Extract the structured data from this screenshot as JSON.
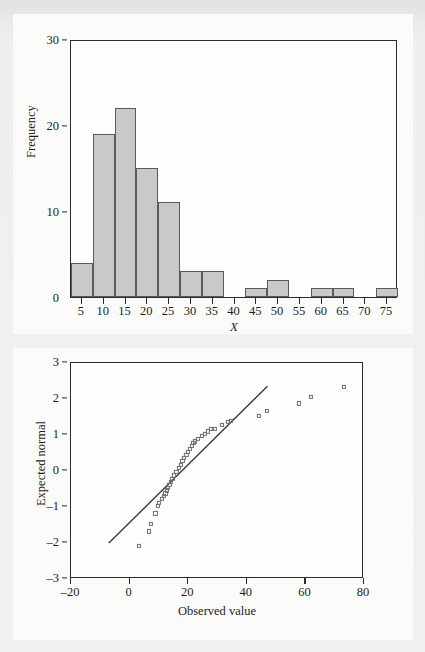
{
  "figure": {
    "background_color": "#f1f0ee",
    "panel_color": "#fbfbfa",
    "axis_color": "#2b2b2b",
    "bar_fill_color": "#c9c9c9",
    "bar_edge_color": "#5a5a5a",
    "marker_edge_color": "#6d6d6d",
    "line_color": "#3a3a3a"
  },
  "chart_data": [
    {
      "type": "bar",
      "id": "histogram",
      "title": "",
      "xlabel": "X",
      "ylabel": "Frequency",
      "xlim": [
        2.5,
        77.5
      ],
      "ylim": [
        0,
        30
      ],
      "grid": false,
      "legend": null,
      "bin_width": 5,
      "xticks": [
        5,
        10,
        15,
        20,
        25,
        30,
        35,
        40,
        45,
        50,
        55,
        60,
        65,
        70,
        75
      ],
      "xtick_labels": [
        "5",
        "10",
        "15",
        "20",
        "25",
        "30",
        "35",
        "40",
        "45",
        "50",
        "55",
        "60",
        "65",
        "70",
        "75"
      ],
      "yticks": [
        0,
        10,
        20,
        30
      ],
      "ytick_labels": [
        "0",
        "10",
        "20",
        "30"
      ],
      "bins": [
        {
          "left": 2.5,
          "right": 7.5,
          "center": 5,
          "value": 4
        },
        {
          "left": 7.5,
          "right": 12.5,
          "center": 10,
          "value": 19
        },
        {
          "left": 12.5,
          "right": 17.5,
          "center": 15,
          "value": 22
        },
        {
          "left": 17.5,
          "right": 22.5,
          "center": 20,
          "value": 15
        },
        {
          "left": 22.5,
          "right": 27.5,
          "center": 25,
          "value": 11
        },
        {
          "left": 27.5,
          "right": 32.5,
          "center": 30,
          "value": 3
        },
        {
          "left": 32.5,
          "right": 37.5,
          "center": 35,
          "value": 3
        },
        {
          "left": 37.5,
          "right": 42.5,
          "center": 40,
          "value": 0
        },
        {
          "left": 42.5,
          "right": 47.5,
          "center": 45,
          "value": 1
        },
        {
          "left": 47.5,
          "right": 52.5,
          "center": 50,
          "value": 2
        },
        {
          "left": 52.5,
          "right": 57.5,
          "center": 55,
          "value": 0
        },
        {
          "left": 57.5,
          "right": 62.5,
          "center": 60,
          "value": 1
        },
        {
          "left": 62.5,
          "right": 67.5,
          "center": 65,
          "value": 1
        },
        {
          "left": 67.5,
          "right": 72.5,
          "center": 70,
          "value": 0
        },
        {
          "left": 72.5,
          "right": 77.5,
          "center": 75,
          "value": 1
        }
      ],
      "categories": [
        "5",
        "10",
        "15",
        "20",
        "25",
        "30",
        "35",
        "40",
        "45",
        "50",
        "55",
        "60",
        "65",
        "70",
        "75"
      ],
      "values": [
        4,
        19,
        22,
        15,
        11,
        3,
        3,
        0,
        1,
        2,
        0,
        1,
        1,
        0,
        1
      ]
    },
    {
      "type": "scatter",
      "id": "normal-qq-plot",
      "title": "",
      "xlabel": "Observed value",
      "ylabel": "Expected normal",
      "xlim": [
        -20,
        80
      ],
      "ylim": [
        -3,
        3
      ],
      "grid": false,
      "legend": null,
      "marker": "open-square",
      "xticks": [
        -20,
        0,
        20,
        40,
        60,
        80
      ],
      "xtick_labels": [
        "–20",
        "0",
        "20",
        "40",
        "60",
        "80"
      ],
      "yticks": [
        -3,
        -2,
        -1,
        0,
        1,
        2,
        3
      ],
      "ytick_labels": [
        "–3",
        "–2",
        "–1",
        "0",
        "1",
        "2",
        "3"
      ],
      "reference_line": {
        "x": [
          -7.0,
          47.5
        ],
        "y": [
          -2.05,
          2.35
        ]
      },
      "points": [
        {
          "x": 3.2,
          "y": -2.08
        },
        {
          "x": 6.5,
          "y": -1.68
        },
        {
          "x": 7.2,
          "y": -1.48
        },
        {
          "x": 8.8,
          "y": -1.18
        },
        {
          "x": 9.6,
          "y": -0.98
        },
        {
          "x": 10.0,
          "y": -0.88
        },
        {
          "x": 11.0,
          "y": -0.78
        },
        {
          "x": 11.6,
          "y": -0.7
        },
        {
          "x": 12.2,
          "y": -0.62
        },
        {
          "x": 12.8,
          "y": -0.54
        },
        {
          "x": 13.2,
          "y": -0.46
        },
        {
          "x": 13.6,
          "y": -0.38
        },
        {
          "x": 14.0,
          "y": -0.3
        },
        {
          "x": 14.6,
          "y": -0.22
        },
        {
          "x": 15.2,
          "y": -0.12
        },
        {
          "x": 16.0,
          "y": -0.02
        },
        {
          "x": 16.8,
          "y": 0.08
        },
        {
          "x": 17.4,
          "y": 0.18
        },
        {
          "x": 18.0,
          "y": 0.27
        },
        {
          "x": 18.6,
          "y": 0.36
        },
        {
          "x": 19.4,
          "y": 0.45
        },
        {
          "x": 20.0,
          "y": 0.54
        },
        {
          "x": 20.6,
          "y": 0.62
        },
        {
          "x": 21.2,
          "y": 0.7
        },
        {
          "x": 21.8,
          "y": 0.78
        },
        {
          "x": 22.4,
          "y": 0.82
        },
        {
          "x": 23.4,
          "y": 0.9
        },
        {
          "x": 24.6,
          "y": 0.98
        },
        {
          "x": 25.6,
          "y": 1.04
        },
        {
          "x": 26.6,
          "y": 1.1
        },
        {
          "x": 27.8,
          "y": 1.16
        },
        {
          "x": 29.2,
          "y": 1.18
        },
        {
          "x": 31.6,
          "y": 1.28
        },
        {
          "x": 33.6,
          "y": 1.36
        },
        {
          "x": 34.6,
          "y": 1.4
        },
        {
          "x": 44.0,
          "y": 1.52
        },
        {
          "x": 47.0,
          "y": 1.66
        },
        {
          "x": 57.8,
          "y": 1.88
        },
        {
          "x": 61.8,
          "y": 2.06
        },
        {
          "x": 73.2,
          "y": 2.34
        }
      ]
    }
  ]
}
